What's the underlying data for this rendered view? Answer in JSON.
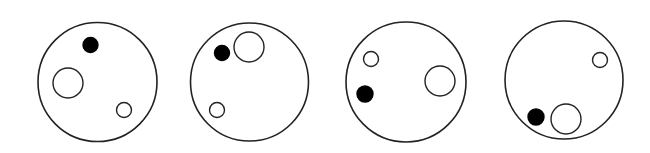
{
  "figure": {
    "stroke_color": "#222222",
    "fill_dark": "#000000",
    "fill_light": "#ffffff",
    "panels": [
      {
        "outer": {
          "cx": 97.5,
          "cy": 82,
          "r": 59.5
        },
        "black_dot": {
          "cx": 90.5,
          "cy": 45,
          "r": 7.5
        },
        "large_open": {
          "cx": 68,
          "cy": 83,
          "r": 15
        },
        "small_open": {
          "cx": 124,
          "cy": 110,
          "r": 7.5
        }
      },
      {
        "outer": {
          "cx": 249.5,
          "cy": 82,
          "r": 59
        },
        "black_dot": {
          "cx": 222,
          "cy": 53,
          "r": 7.5
        },
        "large_open": {
          "cx": 249,
          "cy": 47,
          "r": 15
        },
        "small_open": {
          "cx": 217,
          "cy": 110,
          "r": 7.5
        }
      },
      {
        "outer": {
          "cx": 406,
          "cy": 82,
          "r": 60
        },
        "black_dot": {
          "cx": 365,
          "cy": 94,
          "r": 8
        },
        "large_open": {
          "cx": 440,
          "cy": 81,
          "r": 15
        },
        "small_open": {
          "cx": 371,
          "cy": 59,
          "r": 7.5
        }
      },
      {
        "outer": {
          "cx": 564,
          "cy": 80,
          "r": 59
        },
        "black_dot": {
          "cx": 536,
          "cy": 117,
          "r": 8
        },
        "large_open": {
          "cx": 566,
          "cy": 119,
          "r": 15
        },
        "small_open": {
          "cx": 600,
          "cy": 60,
          "r": 7.5
        }
      }
    ]
  }
}
